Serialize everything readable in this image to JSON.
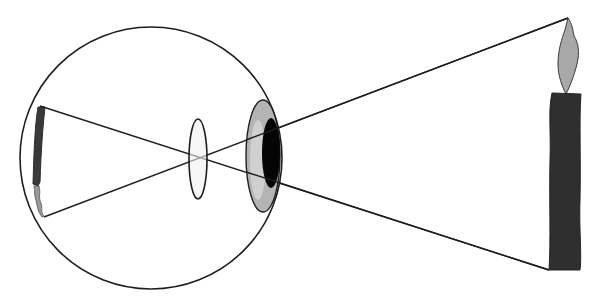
{
  "diagram": {
    "colors": {
      "background": "#ffffff",
      "stroke": "#1e1e1e",
      "iris": "#b4b4b4",
      "pupil": "#050505",
      "lens_fill": "#f2f2f2",
      "candle_body": "#2f2f2f",
      "flame": "#a8a8a8",
      "retina_image": "#3a3a3a",
      "retina_flame": "#9a9a9a"
    },
    "eyeball": {
      "cx": 151,
      "cy": 158,
      "r": 131
    },
    "lens": {
      "cx": 198,
      "cy": 159,
      "rx": 9,
      "ry": 40
    },
    "cornea_iris": {
      "cx": 263,
      "cy": 156,
      "rx": 17,
      "ry": 56
    },
    "pupil": {
      "cx": 271,
      "cy": 153,
      "rx": 9,
      "ry": 35
    },
    "candle": {
      "x": 550,
      "y": 93,
      "width": 32,
      "height": 177
    },
    "rays": [
      {
        "name": "ray-from-flame-tip",
        "x1": 568,
        "y1": 18,
        "x2": 44,
        "y2": 217
      },
      {
        "name": "ray-from-candle-base",
        "x1": 549,
        "y1": 270,
        "x2": 40,
        "y2": 106
      }
    ]
  }
}
